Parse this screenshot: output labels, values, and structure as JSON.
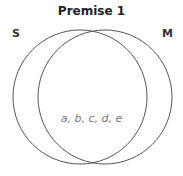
{
  "diagram": {
    "title": "Premise 1",
    "left_set": "S",
    "right_set": "M",
    "intersection_members": "a, b, c, d, e",
    "circle_color": "#555555"
  }
}
